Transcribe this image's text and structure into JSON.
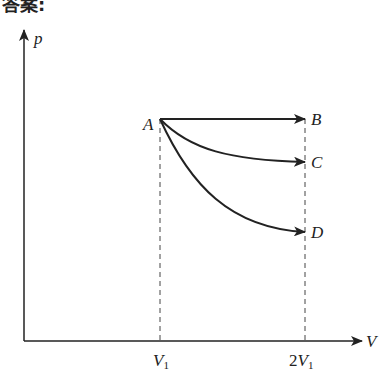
{
  "header": {
    "title": "答案:",
    "trailing": "C"
  },
  "diagram": {
    "y_axis_label": "p",
    "x_axis_label": "V",
    "x_ticks": [
      {
        "label": "V",
        "sub": "1",
        "prefix": ""
      },
      {
        "label": "V",
        "sub": "1",
        "prefix": "2"
      }
    ],
    "points": [
      {
        "name": "A"
      },
      {
        "name": "B"
      },
      {
        "name": "C"
      },
      {
        "name": "D"
      }
    ],
    "processes": [
      "A→B",
      "A→C",
      "A→D"
    ]
  },
  "colors": {
    "line": "#222222",
    "dash": "#444444"
  }
}
